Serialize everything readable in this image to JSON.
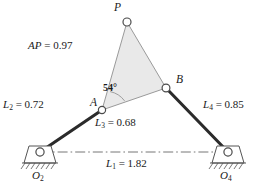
{
  "figure": {
    "type": "fourbar-linkage-kinematic-diagram"
  },
  "points": {
    "P": {
      "label": "P",
      "x": 127,
      "y": 22
    },
    "A": {
      "label": "A",
      "x": 102,
      "y": 110
    },
    "B": {
      "label": "B",
      "x": 166,
      "y": 88
    },
    "O2": {
      "label": "O",
      "sub": "2",
      "x": 40,
      "y": 152
    },
    "O4": {
      "label": "O",
      "sub": "4",
      "x": 228,
      "y": 152
    }
  },
  "labels": {
    "P": "P",
    "A": "A",
    "B": "B",
    "O2_base": "O",
    "O2_sub": "2",
    "O4_base": "O",
    "O4_sub": "4"
  },
  "dimensions": [
    {
      "name": "L1",
      "base": "L",
      "sub": "1",
      "eq": " = ",
      "value": "1.82"
    },
    {
      "name": "L2",
      "base": "L",
      "sub": "2",
      "eq": " = ",
      "value": "0.72"
    },
    {
      "name": "L3",
      "base": "L",
      "sub": "3",
      "eq": " = ",
      "value": "0.68"
    },
    {
      "name": "L4",
      "base": "L",
      "sub": "4",
      "eq": " = ",
      "value": "0.85"
    },
    {
      "name": "AP",
      "base": "AP",
      "sub": "",
      "eq": " = ",
      "value": "0.97"
    }
  ],
  "angle": {
    "label": "54°",
    "value": 54,
    "at": "A",
    "between": [
      "AB",
      "AP"
    ]
  },
  "colors": {
    "ink": "#1a1a1a",
    "link_stroke": "#2b2b2b",
    "coupler_fill": "#e9e9e9",
    "coupler_stroke": "#9a9a9a",
    "joint_fill": "#ffffff",
    "joint_stroke": "#4a4a4a",
    "ground_stroke": "#555555",
    "centerline": "#666666"
  }
}
